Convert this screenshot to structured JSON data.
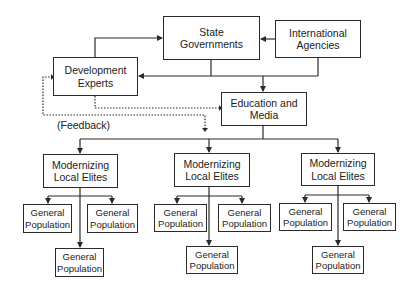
{
  "diagram": {
    "nodes": {
      "state_governments": "State\nGovernments",
      "international_agencies": "International\nAgencies",
      "development_experts": "Development\nExperts",
      "education_media": "Education and\nMedia",
      "elites": [
        "Modernizing\nLocal Elites",
        "Modernizing\nLocal Elites",
        "Modernizing\nLocal Elites"
      ],
      "population": [
        [
          "General\nPopulation",
          "General\nPopulation",
          "General\nPopulation"
        ],
        [
          "General\nPopulation",
          "General\nPopulation",
          "General\nPopulation"
        ],
        [
          "General\nPopulation",
          "General\nPopulation",
          "General\nPopulation"
        ]
      ]
    },
    "feedback_label": "(Feedback)",
    "edges": [
      {
        "from": "Development Experts",
        "to": "State Governments",
        "style": "solid"
      },
      {
        "from": "International Agencies",
        "to": "State Governments",
        "style": "solid"
      },
      {
        "from": "State Governments + International Agencies",
        "to": "Development Experts",
        "style": "solid"
      },
      {
        "from": "State Governments + International Agencies",
        "to": "Education and Media",
        "style": "solid"
      },
      {
        "from": "Development Experts",
        "to": "Education and Media",
        "style": "dotted"
      },
      {
        "from": "Modernizing Local Elites (Feedback)",
        "to": "Development Experts",
        "style": "dotted"
      },
      {
        "from": "Education and Media",
        "to": "Modernizing Local Elites x3",
        "style": "solid"
      },
      {
        "from": "Modernizing Local Elites",
        "to": "General Population x3 (each)",
        "style": "solid"
      }
    ],
    "colors": {
      "line": "#2a2a2a",
      "background": "#ffffff",
      "text": "#222222"
    }
  }
}
